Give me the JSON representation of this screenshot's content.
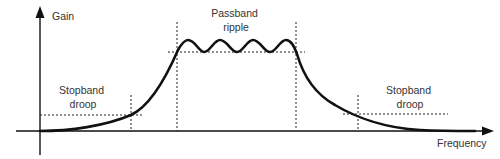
{
  "diagram": {
    "type": "bandpass-filter-response",
    "y_axis_label": "Gain",
    "x_axis_label": "Frequency",
    "annotations": {
      "passband": [
        "Passband",
        "ripple"
      ],
      "stopband_left": [
        "Stopband",
        "droop"
      ],
      "stopband_right": [
        "Stopband",
        "droop"
      ]
    },
    "ripple_peaks": 4,
    "colors": {
      "curve": "#111111",
      "axes": "#111111",
      "text": "#333333",
      "background": "#ffffff"
    }
  }
}
